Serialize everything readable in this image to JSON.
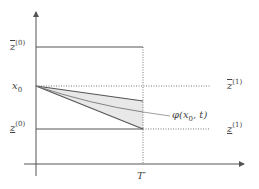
{
  "diagram": {
    "axes": {
      "color": "#555555"
    },
    "labels": {
      "z_bar_0": {
        "base": "z",
        "sup": "(0)",
        "decoration": "overline"
      },
      "x0": {
        "base": "x",
        "sub": "0"
      },
      "z_under_0": {
        "base": "z",
        "sup": "(0)",
        "decoration": "underline"
      },
      "z_bar_1": {
        "base": "z",
        "sup": "(1)",
        "decoration": "overline"
      },
      "z_under_1": {
        "base": "z",
        "sup": "(1)",
        "decoration": "underline"
      },
      "phi": "φ(x",
      "phi_sub": "0",
      "phi_tail": ", t)",
      "t_prime": "T′"
    },
    "colors": {
      "line": "#555555",
      "dotted": "#777777",
      "fill": "#e6e6e6",
      "text": "#444444"
    }
  }
}
